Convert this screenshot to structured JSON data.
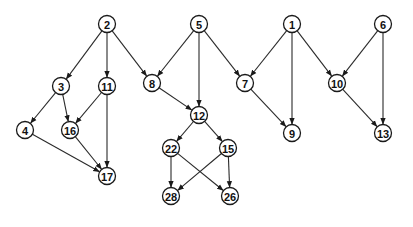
{
  "diagram": {
    "type": "directed-acyclic-graph",
    "node_radius": 8.5,
    "colors": {
      "stroke": "#1a1a1a",
      "fill": "#ffffff",
      "text": "#111111",
      "background": "#ffffff"
    },
    "nodes": [
      {
        "id": "2",
        "label": "2",
        "x": 107,
        "y": 24
      },
      {
        "id": "5",
        "label": "5",
        "x": 199,
        "y": 24
      },
      {
        "id": "1",
        "label": "1",
        "x": 292,
        "y": 24
      },
      {
        "id": "6",
        "label": "6",
        "x": 383,
        "y": 24
      },
      {
        "id": "3",
        "label": "3",
        "x": 61,
        "y": 86
      },
      {
        "id": "11",
        "label": "11",
        "x": 107,
        "y": 86
      },
      {
        "id": "8",
        "label": "8",
        "x": 152,
        "y": 83
      },
      {
        "id": "7",
        "label": "7",
        "x": 245,
        "y": 83
      },
      {
        "id": "10",
        "label": "10",
        "x": 337,
        "y": 83
      },
      {
        "id": "4",
        "label": "4",
        "x": 25,
        "y": 130
      },
      {
        "id": "16",
        "label": "16",
        "x": 70,
        "y": 130
      },
      {
        "id": "12",
        "label": "12",
        "x": 199,
        "y": 115
      },
      {
        "id": "9",
        "label": "9",
        "x": 292,
        "y": 133
      },
      {
        "id": "13",
        "label": "13",
        "x": 383,
        "y": 133
      },
      {
        "id": "17",
        "label": "17",
        "x": 107,
        "y": 176
      },
      {
        "id": "22",
        "label": "22",
        "x": 171,
        "y": 148
      },
      {
        "id": "15",
        "label": "15",
        "x": 228,
        "y": 148
      },
      {
        "id": "28",
        "label": "28",
        "x": 171,
        "y": 196
      },
      {
        "id": "26",
        "label": "26",
        "x": 230,
        "y": 196
      }
    ],
    "edges": [
      {
        "from": "2",
        "to": "3"
      },
      {
        "from": "2",
        "to": "11"
      },
      {
        "from": "2",
        "to": "8"
      },
      {
        "from": "5",
        "to": "8"
      },
      {
        "from": "5",
        "to": "12"
      },
      {
        "from": "5",
        "to": "7"
      },
      {
        "from": "1",
        "to": "7"
      },
      {
        "from": "1",
        "to": "9"
      },
      {
        "from": "1",
        "to": "10"
      },
      {
        "from": "6",
        "to": "10"
      },
      {
        "from": "6",
        "to": "13"
      },
      {
        "from": "3",
        "to": "4"
      },
      {
        "from": "3",
        "to": "16"
      },
      {
        "from": "11",
        "to": "16"
      },
      {
        "from": "11",
        "to": "17"
      },
      {
        "from": "4",
        "to": "17"
      },
      {
        "from": "16",
        "to": "17"
      },
      {
        "from": "8",
        "to": "12"
      },
      {
        "from": "7",
        "to": "9"
      },
      {
        "from": "10",
        "to": "13"
      },
      {
        "from": "12",
        "to": "22"
      },
      {
        "from": "12",
        "to": "15"
      },
      {
        "from": "22",
        "to": "28"
      },
      {
        "from": "22",
        "to": "26"
      },
      {
        "from": "15",
        "to": "28"
      },
      {
        "from": "15",
        "to": "26"
      }
    ]
  }
}
